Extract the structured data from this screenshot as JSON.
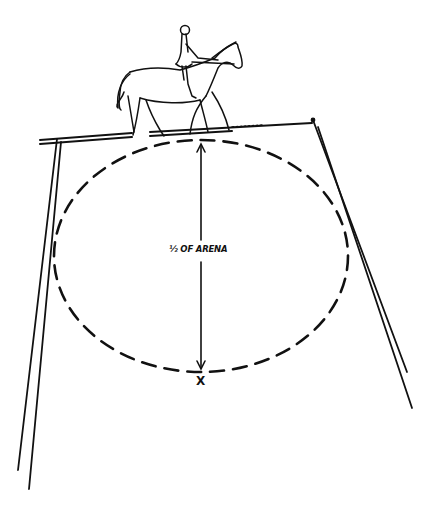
{
  "diagram": {
    "arena_label": "½ OF ARENA",
    "center_marker": "X",
    "ink_color": "#111111",
    "background_color": "#ffffff",
    "elements": {
      "horse_and_rider": "horse walking right with rider seated, at top of circle on arena rail",
      "arena_rail": "double-line rail forming top and two sides of arena in perspective",
      "circle": "dashed ellipse (circle in perspective) touching top rail and X",
      "measure_arrow": "double-headed vertical arrow from top rail to X indicating diameter equals half of arena"
    }
  }
}
